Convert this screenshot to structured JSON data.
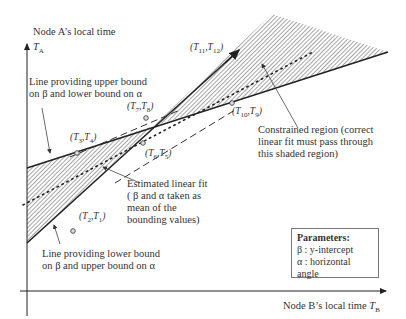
{
  "axes": {
    "y_title": "Node A’s local time",
    "y_symbol": "T",
    "y_sub": "A",
    "x_title": "Node B’s local time ",
    "x_symbol": "T",
    "x_sub": "B"
  },
  "annotations": {
    "upper_line_1": "Line providing upper bound",
    "upper_line_2": "on β and lower bound on α",
    "lower_line_1": "Line providing lower bound",
    "lower_line_2": "on β and upper bound on α",
    "fit_1": "Estimated linear fit",
    "fit_2": "( β and α taken as",
    "fit_3": "mean of the",
    "fit_4": "bounding values)",
    "region_1": "Constrained region (correct",
    "region_2": "linear fit must pass through",
    "region_3": "this shaded region)"
  },
  "points": [
    {
      "a": "T",
      "as": "2",
      "b": "T",
      "bs": "1"
    },
    {
      "a": "T",
      "as": "3",
      "b": "T",
      "bs": "4"
    },
    {
      "a": "T",
      "as": "6",
      "b": "T",
      "bs": "5"
    },
    {
      "a": "T",
      "as": "7",
      "b": "T",
      "bs": "8"
    },
    {
      "a": "T",
      "as": "10",
      "b": "T",
      "bs": "9"
    },
    {
      "a": "T",
      "as": "11",
      "b": "T",
      "bs": "12"
    }
  ],
  "legend": {
    "title": "Parameters:",
    "beta": "β : y-intercept",
    "alpha": "α : horizontal angle"
  },
  "colors": {
    "line": "#222222",
    "hatch": "#555555",
    "text": "#333333"
  }
}
